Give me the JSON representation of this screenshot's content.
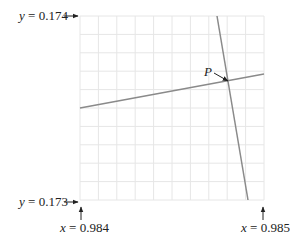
{
  "labels": {
    "y_top": {
      "var": "y",
      "eq": " = ",
      "value": "0.174"
    },
    "y_bottom": {
      "var": "y",
      "eq": " = ",
      "value": "0.173"
    },
    "x_left": {
      "var": "x",
      "eq": " = ",
      "value": "0.984"
    },
    "x_right": {
      "var": "x",
      "eq": " = ",
      "value": "0.985"
    },
    "point": "P"
  },
  "grid": {
    "columns": 10,
    "rows": 10,
    "color": "#e6e6e6"
  },
  "lines": {
    "shallow": {
      "color": "#8a8a8a",
      "x1": 80,
      "y1": 108,
      "x2": 264,
      "y2": 74
    },
    "steep": {
      "color": "#8a8a8a",
      "x1": 217,
      "y1": 16,
      "x2": 248,
      "y2": 200
    }
  },
  "colors": {
    "text": "#222222",
    "arrow": "#222222"
  }
}
